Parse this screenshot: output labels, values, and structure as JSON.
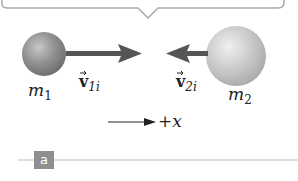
{
  "panel": {
    "label": "a"
  },
  "objects": [
    {
      "mass_label": "m",
      "mass_sub": "1",
      "velocity_label": "v",
      "velocity_sub": "1i",
      "direction": "right"
    },
    {
      "mass_label": "m",
      "mass_sub": "2",
      "velocity_label": "v",
      "velocity_sub": "2i",
      "direction": "left"
    }
  ],
  "axis": {
    "label": "+x"
  },
  "colors": {
    "arrow": "#555555",
    "sphere1": "#8a8a8a",
    "sphere2": "#bdbdbd",
    "divider": "#bbbbbb",
    "badge": "#8f8f8f"
  }
}
